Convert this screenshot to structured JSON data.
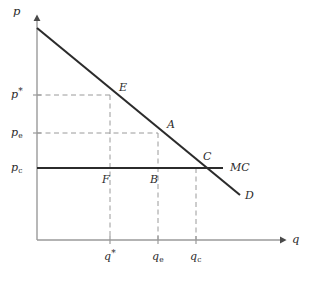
{
  "figure": {
    "kind": "economics-supply-demand-diagram",
    "background_color": "#ffffff",
    "ink_color": "#2b2b2b",
    "axis_color": "#9a9a9a",
    "dash_color": "#9a9a9a"
  },
  "axes": {
    "y_label": "p",
    "x_label": "q",
    "origin": {
      "x": 37,
      "y": 240
    },
    "x_end": {
      "x": 285,
      "y": 240
    },
    "y_top": {
      "x": 37,
      "y": 14
    }
  },
  "y_ticks": [
    {
      "id": "p-star",
      "base": "p",
      "sup": "*",
      "sub": "",
      "y": 95
    },
    {
      "id": "p-e",
      "base": "p",
      "sup": "",
      "sub": "e",
      "y": 133
    },
    {
      "id": "p-c",
      "base": "p",
      "sup": "",
      "sub": "c",
      "y": 168
    }
  ],
  "x_ticks": [
    {
      "id": "q-star",
      "base": "q",
      "sup": "*",
      "sub": "",
      "x": 110
    },
    {
      "id": "q-e",
      "base": "q",
      "sup": "",
      "sub": "e",
      "x": 158
    },
    {
      "id": "q-c",
      "base": "q",
      "sup": "",
      "sub": "c",
      "x": 196
    }
  ],
  "curves": {
    "demand": {
      "label": "D",
      "from": {
        "x": 37,
        "y": 28
      },
      "to": {
        "x": 240,
        "y": 195
      },
      "label_pos": {
        "x": 245,
        "y": 195
      }
    },
    "marginal_cost": {
      "label": "MC",
      "from": {
        "x": 37,
        "y": 168
      },
      "to": {
        "x": 223,
        "y": 168
      },
      "label_pos": {
        "x": 230,
        "y": 163
      }
    }
  },
  "points": [
    {
      "label": "E",
      "x": 110,
      "y": 95,
      "label_pos": {
        "x": 119,
        "y": 82
      }
    },
    {
      "label": "A",
      "x": 158,
      "y": 133,
      "label_pos": {
        "x": 167,
        "y": 119
      }
    },
    {
      "label": "C",
      "x": 196,
      "y": 168,
      "label_pos": {
        "x": 203,
        "y": 151
      }
    },
    {
      "label": "B",
      "x": 158,
      "y": 168,
      "label_pos": {
        "x": 150,
        "y": 174
      }
    },
    {
      "label": "F",
      "x": 110,
      "y": 168,
      "label_pos": {
        "x": 102,
        "y": 174
      }
    }
  ],
  "dashed_guides": [
    {
      "id": "p-star-horizontal",
      "x1": 37,
      "y1": 95,
      "x2": 110,
      "y2": 95
    },
    {
      "id": "p-e-horizontal",
      "x1": 37,
      "y1": 133,
      "x2": 158,
      "y2": 133
    },
    {
      "id": "q-star-vertical",
      "x1": 110,
      "y1": 95,
      "x2": 110,
      "y2": 240
    },
    {
      "id": "q-e-vertical",
      "x1": 158,
      "y1": 133,
      "x2": 158,
      "y2": 240
    },
    {
      "id": "q-c-vertical",
      "x1": 196,
      "y1": 168,
      "x2": 196,
      "y2": 240
    }
  ]
}
